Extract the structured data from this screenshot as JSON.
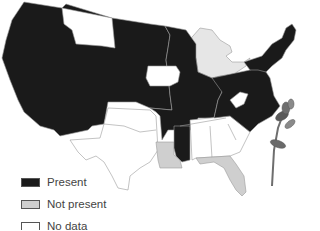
{
  "map": {
    "title": "",
    "colors": {
      "present": "#1a1a1a",
      "not_present": "#cfcfcf",
      "no_data": "#ffffff",
      "border": "#9a9a9a",
      "great_lakes": "#e6e6e6"
    },
    "regions": [
      {
        "name": "West (WA, OR, CA, NV, ID, UT, AZ)",
        "status": "present"
      },
      {
        "name": "Montana",
        "status": "no_data"
      },
      {
        "name": "Wyoming, Colorado, New Mexico",
        "status": "present"
      },
      {
        "name": "Dakotas, Nebraska, Kansas",
        "status": "present"
      },
      {
        "name": "Iowa",
        "status": "no_data"
      },
      {
        "name": "Oklahoma",
        "status": "no_data"
      },
      {
        "name": "Texas",
        "status": "no_data"
      },
      {
        "name": "Minnesota, Wisconsin, Illinois, Missouri",
        "status": "present"
      },
      {
        "name": "Arkansas, Mississippi",
        "status": "present"
      },
      {
        "name": "Louisiana",
        "status": "not_present"
      },
      {
        "name": "Michigan",
        "status": "no_data"
      },
      {
        "name": "Indiana, Ohio, Kentucky",
        "status": "present"
      },
      {
        "name": "Tennessee",
        "status": "no_data"
      },
      {
        "name": "Alabama",
        "status": "no_data"
      },
      {
        "name": "Georgia",
        "status": "no_data"
      },
      {
        "name": "South Carolina",
        "status": "no_data"
      },
      {
        "name": "Florida",
        "status": "not_present"
      },
      {
        "name": "West Virginia",
        "status": "no_data"
      },
      {
        "name": "North Carolina, Virginia",
        "status": "present"
      },
      {
        "name": "Northeast (PA, NY, New England, NJ, MD, DE)",
        "status": "present"
      }
    ]
  },
  "legend": {
    "items": [
      {
        "label": "Present",
        "color": "#1a1a1a"
      },
      {
        "label": "Not present",
        "color": "#cfcfcf"
      },
      {
        "label": "No data",
        "color": "#ffffff"
      }
    ]
  },
  "illustration": {
    "name": "flowering plant stem"
  }
}
